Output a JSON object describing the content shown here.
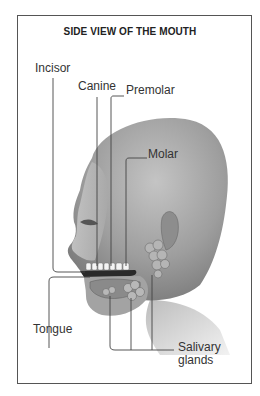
{
  "diagram": {
    "title": "SIDE VIEW OF THE MOUTH",
    "labels": {
      "incisor": "Incisor",
      "canine": "Canine",
      "premolar": "Premolar",
      "molar": "Molar",
      "tongue": "Tongue",
      "salivary_line1": "Salivary",
      "salivary_line2": "glands"
    },
    "illustration": "head-profile-facing-left-with-teeth-tongue-salivary-glands",
    "colors": {
      "frame": "#555555",
      "lines": "#444444",
      "skin_dark": "#8a8a8a",
      "skin_light": "#d9d9d9"
    }
  }
}
